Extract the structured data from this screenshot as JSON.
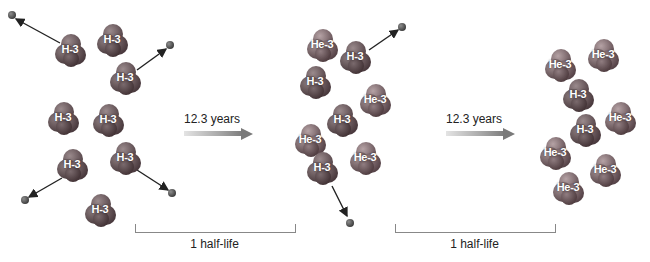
{
  "diagram": {
    "colors": {
      "molecule": "#5b4a4e",
      "electron": "#3a3a3a",
      "arrow": "#222222",
      "timeline_arrow_end": "#7a7a7a",
      "bracket": "#888888"
    },
    "panels": [
      {
        "name": "initial",
        "molecules": [
          {
            "label": "H-3",
            "x": 70,
            "y": 50
          },
          {
            "label": "H-3",
            "x": 112,
            "y": 40
          },
          {
            "label": "H-3",
            "x": 125,
            "y": 78
          },
          {
            "label": "H-3",
            "x": 63,
            "y": 118
          },
          {
            "label": "H-3",
            "x": 108,
            "y": 120
          },
          {
            "label": "H-3",
            "x": 72,
            "y": 165
          },
          {
            "label": "H-3",
            "x": 125,
            "y": 158
          },
          {
            "label": "H-3",
            "x": 100,
            "y": 210
          }
        ],
        "emissions": [
          {
            "from": [
              60,
              43
            ],
            "to": [
              16,
              19
            ]
          },
          {
            "from": [
              137,
              70
            ],
            "to": [
              166,
              49
            ]
          },
          {
            "from": [
              62,
              178
            ],
            "to": [
              29,
              197
            ]
          },
          {
            "from": [
              137,
              170
            ],
            "to": [
              168,
              190
            ]
          }
        ]
      },
      {
        "name": "after-1-half-life",
        "molecules": [
          {
            "label": "He-3",
            "x": 322,
            "y": 45
          },
          {
            "label": "H-3",
            "x": 355,
            "y": 57
          },
          {
            "label": "H-3",
            "x": 315,
            "y": 82
          },
          {
            "label": "He-3",
            "x": 375,
            "y": 100
          },
          {
            "label": "H-3",
            "x": 342,
            "y": 120
          },
          {
            "label": "He-3",
            "x": 310,
            "y": 140
          },
          {
            "label": "He-3",
            "x": 365,
            "y": 158
          },
          {
            "label": "H-3",
            "x": 322,
            "y": 168
          }
        ],
        "emissions": [
          {
            "from": [
              369,
              50
            ],
            "to": [
              398,
              30
            ]
          },
          {
            "from": [
              332,
              186
            ],
            "to": [
              347,
              216
            ]
          }
        ]
      },
      {
        "name": "after-2-half-lives",
        "molecules": [
          {
            "label": "He-3",
            "x": 560,
            "y": 65
          },
          {
            "label": "He-3",
            "x": 603,
            "y": 55
          },
          {
            "label": "H-3",
            "x": 578,
            "y": 95
          },
          {
            "label": "He-3",
            "x": 620,
            "y": 118
          },
          {
            "label": "H-3",
            "x": 585,
            "y": 130
          },
          {
            "label": "He-3",
            "x": 555,
            "y": 153
          },
          {
            "label": "He-3",
            "x": 605,
            "y": 170
          },
          {
            "label": "He-3",
            "x": 568,
            "y": 188
          }
        ],
        "emissions": []
      }
    ],
    "electrons": [
      {
        "x": 12,
        "y": 15
      },
      {
        "x": 170,
        "y": 45
      },
      {
        "x": 25,
        "y": 200
      },
      {
        "x": 172,
        "y": 193
      },
      {
        "x": 402,
        "y": 27
      },
      {
        "x": 350,
        "y": 223
      }
    ],
    "transitions": [
      {
        "label": "12.3 years",
        "x": 184,
        "y": 112,
        "bar_x": 184,
        "bar_y": 133,
        "bar_w": 57
      },
      {
        "label": "12.3 years",
        "x": 446,
        "y": 112,
        "bar_x": 446,
        "bar_y": 133,
        "bar_w": 57
      }
    ],
    "brackets": [
      {
        "label": "1 half-life",
        "x": 135,
        "y": 224,
        "w": 159
      },
      {
        "label": "1 half-life",
        "x": 395,
        "y": 224,
        "w": 159
      }
    ]
  }
}
